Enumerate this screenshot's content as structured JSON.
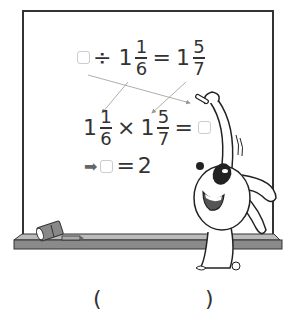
{
  "equation1": {
    "operator_div": "÷",
    "mixed1_whole": "1",
    "mixed1_num": "1",
    "mixed1_den": "6",
    "equals": "=",
    "mixed2_whole": "1",
    "mixed2_num": "5",
    "mixed2_den": "7"
  },
  "equation2": {
    "mixed1_whole": "1",
    "mixed1_num": "1",
    "mixed1_den": "6",
    "operator_mul": "×",
    "mixed2_whole": "1",
    "mixed2_num": "5",
    "mixed2_den": "7",
    "equals": "="
  },
  "equation3": {
    "arrow": "➡",
    "equals": "=",
    "result": "2"
  },
  "answer": {
    "open_paren": "(",
    "close_paren": ")"
  },
  "colors": {
    "ledge": "#8a8a8a",
    "box_border": "#cccccc",
    "ink": "#333333"
  }
}
